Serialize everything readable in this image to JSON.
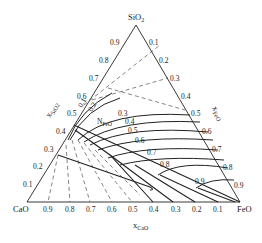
{
  "diagram": {
    "type": "ternary",
    "vertices": {
      "top": "SiO2",
      "left": "CaO",
      "right": "FeO"
    },
    "axis_labels": {
      "left_edge": "xSiO2",
      "right_edge": "xFeO",
      "bottom_edge": "xCaO"
    },
    "left_ticks": [
      "0.9",
      "0.8",
      "0.7",
      "0.6",
      "0.5",
      "0.4",
      "0.3",
      "0.2",
      "0.1"
    ],
    "right_ticks": [
      "0.1",
      "0.2",
      "0.3",
      "0.4",
      "0.5",
      "0.6",
      "0.7",
      "0.8",
      "0.9"
    ],
    "bottom_ticks": [
      "0.9",
      "0.8",
      "0.7",
      "0.6",
      "0.5",
      "0.4",
      "0.3",
      "0.2",
      "0.1"
    ],
    "iso_activity_label": "NFeO",
    "iso_activity_values": [
      "0.1",
      "0.2",
      "0.3",
      "0.4",
      "0.5",
      "0.6",
      "0.7",
      "0.8",
      "0.9"
    ],
    "line_styles": {
      "iso_activity": "solid",
      "phase_boundary": "dashed"
    },
    "colors": {
      "line": "#222222",
      "background": "#ffffff"
    }
  }
}
